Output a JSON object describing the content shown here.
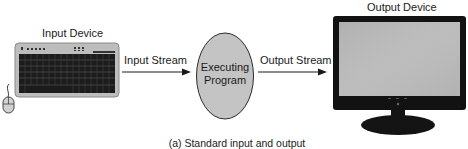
{
  "diagram": {
    "title": "Standard input and output",
    "caption": "(a) Standard input and output",
    "nodes": [
      {
        "id": "input_device",
        "label": "Input Device",
        "icon": "keyboard-and-mouse-icon"
      },
      {
        "id": "program",
        "label_line1": "Executing",
        "label_line2": "Program",
        "shape": "ellipse"
      },
      {
        "id": "output_device",
        "label": "Output Device",
        "icon": "monitor-icon"
      }
    ],
    "edges": [
      {
        "from": "input_device",
        "to": "program",
        "label": "Input Stream"
      },
      {
        "from": "program",
        "to": "output_device",
        "label": "Output Stream"
      }
    ],
    "colors": {
      "ellipse_fill": "#c4c4c4",
      "outline": "#2a2a2a",
      "keyboard_body": "#bdbdbd",
      "keys": "#1c1c1c",
      "monitor_bezel": "#111111",
      "screen": "#b9b9b9"
    }
  }
}
